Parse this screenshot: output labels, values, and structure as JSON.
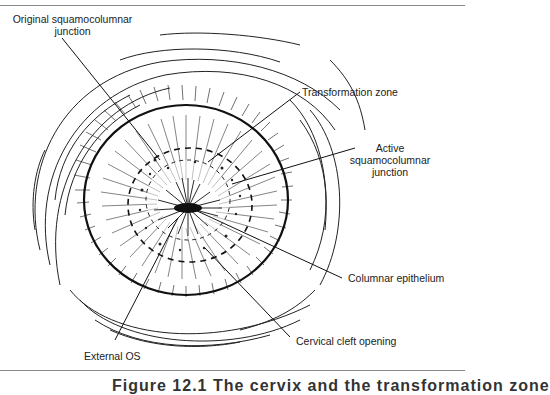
{
  "figure": {
    "labels": {
      "original_scj": "Original squamocolumnar",
      "original_scj_2": "junction",
      "transformation_zone": "Transformation zone",
      "active_scj_1": "Active",
      "active_scj_2": "squamocolumnar",
      "active_scj_3": "junction",
      "columnar_epithelium": "Columnar epithelium",
      "cervical_cleft": "Cervical cleft opening",
      "external_os": "External OS"
    },
    "caption": "Figure 12.1  The cervix and the transformation zone"
  }
}
